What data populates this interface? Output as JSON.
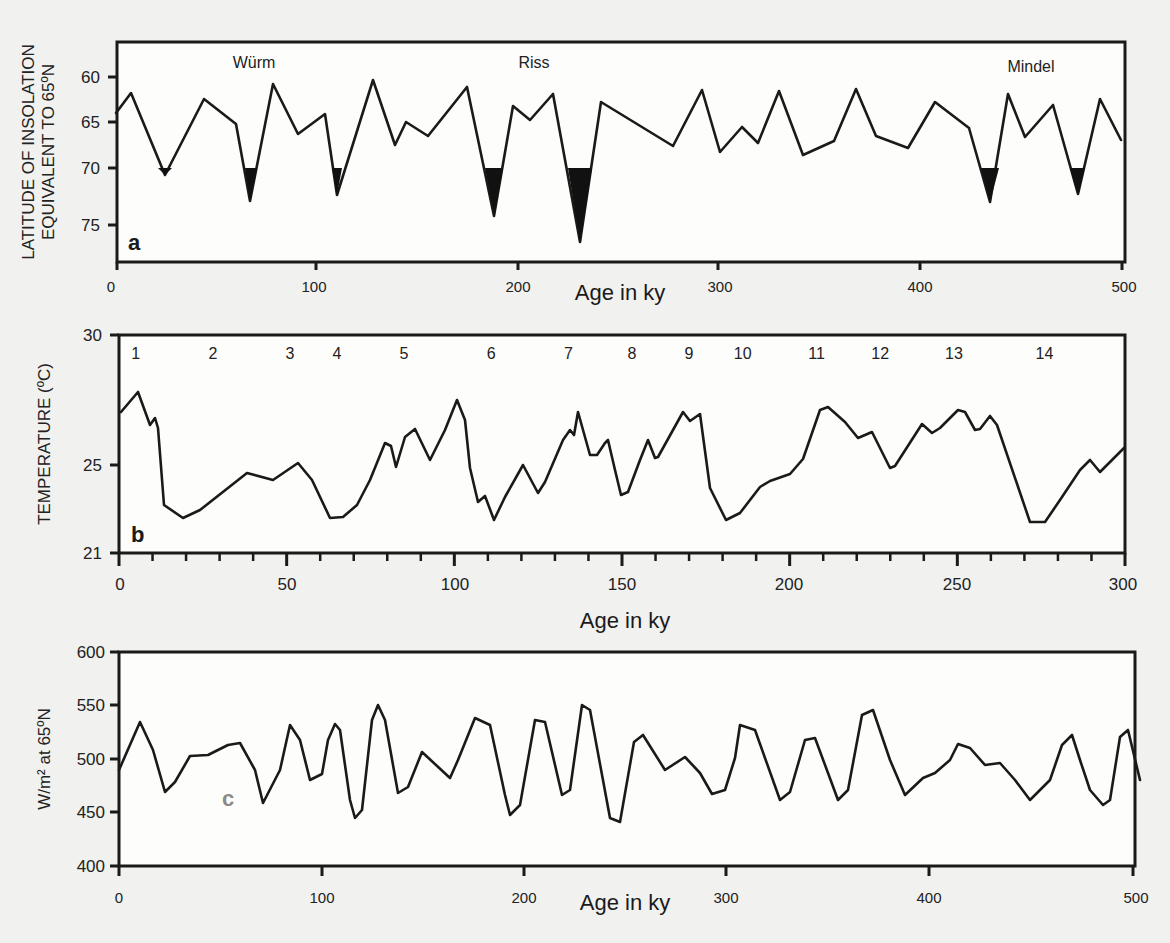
{
  "figure": {
    "panel_a": {
      "label": "a",
      "ylabel_line1": "LATITUDE OF INSOLATION",
      "ylabel_line2": "EQUIVALENT TO 65ºN",
      "xlabel": "Age in ky",
      "yticks": [
        "60",
        "65",
        "70",
        "75"
      ],
      "xticks": [
        "0",
        "100",
        "200",
        "300",
        "400",
        "500"
      ],
      "annotations": [
        "Würm",
        "Riss",
        "Mindel"
      ]
    },
    "panel_b": {
      "label": "b",
      "ylabel": "TEMPERATURE (ºC)",
      "xlabel": "Age in ky",
      "yticks": [
        "30",
        "25",
        "21"
      ],
      "xticks": [
        "0",
        "50",
        "100",
        "150",
        "200",
        "250",
        "300"
      ],
      "stage_numbers": [
        "1",
        "2",
        "3",
        "4",
        "5",
        "6",
        "7",
        "8",
        "9",
        "10",
        "11",
        "12",
        "13",
        "14"
      ]
    },
    "panel_c": {
      "label": "c",
      "ylabel": "W/m² at 65ºN",
      "xlabel": "Age in ky",
      "yticks": [
        "600",
        "550",
        "500",
        "450",
        "400"
      ],
      "xticks": [
        "0",
        "100",
        "200",
        "300",
        "400",
        "500"
      ]
    }
  },
  "chart_data": [
    {
      "type": "line",
      "panel": "a",
      "title": "",
      "xlabel": "Age in ky",
      "ylabel": "Latitude of insolation equivalent to 65ºN",
      "xlim": [
        0,
        500
      ],
      "ylim": [
        78,
        57
      ],
      "y_inverted": true,
      "annotations": [
        {
          "text": "Würm",
          "x": 65
        },
        {
          "text": "Riss",
          "x": 190
        },
        {
          "text": "Mindel",
          "x": 460
        }
      ],
      "shaded_glacial_minima_below": 69,
      "x": [
        0,
        7,
        24,
        43,
        59,
        66,
        77,
        90,
        103,
        109,
        127,
        138,
        143,
        144,
        151,
        161,
        174,
        188,
        197,
        205,
        218,
        229,
        239,
        275,
        290,
        299,
        310,
        318,
        329,
        331,
        343,
        358,
        369,
        380,
        396,
        410,
        428,
        441,
        448,
        456,
        462,
        470,
        484,
        493,
        506
      ],
      "y": [
        63.6,
        61.6,
        69.9,
        62.2,
        64.8,
        72.6,
        60.7,
        65.8,
        63.8,
        72.0,
        60.3,
        66.9,
        67.2,
        64.8,
        66.2,
        61.2,
        74.3,
        63.2,
        64.6,
        62.0,
        77.0,
        62.8,
        67.2,
        61.5,
        67.8,
        65.2,
        66.8,
        61.6,
        62.4,
        68.5,
        67.1,
        61.3,
        66.0,
        67.2,
        62.6,
        65.3,
        72.8,
        61.9,
        65.8,
        62.7,
        71.0,
        62.1,
        65.5,
        64.5,
        66.5
      ]
    },
    {
      "type": "line",
      "panel": "b",
      "title": "",
      "xlabel": "Age in ky",
      "ylabel": "Temperature (ºC)",
      "xlim": [
        0,
        300
      ],
      "ylim": [
        21,
        30
      ],
      "stage_numbers": [
        {
          "n": "1",
          "x": 5
        },
        {
          "n": "2",
          "x": 28
        },
        {
          "n": "3",
          "x": 51
        },
        {
          "n": "4",
          "x": 65
        },
        {
          "n": "5",
          "x": 85
        },
        {
          "n": "6",
          "x": 111
        },
        {
          "n": "7",
          "x": 134
        },
        {
          "n": "8",
          "x": 153
        },
        {
          "n": "9",
          "x": 170
        },
        {
          "n": "10",
          "x": 186
        },
        {
          "n": "11",
          "x": 208
        },
        {
          "n": "12",
          "x": 227
        },
        {
          "n": "13",
          "x": 249
        },
        {
          "n": "14",
          "x": 276
        }
      ],
      "x": [
        1,
        6,
        9,
        11,
        12,
        13,
        19,
        24,
        38,
        46,
        53,
        57,
        63,
        67,
        71,
        75,
        79,
        81,
        84,
        89,
        93,
        96,
        101,
        103,
        105,
        108,
        110,
        112,
        115,
        120,
        125,
        128,
        131,
        133,
        134,
        137,
        140,
        142,
        143,
        145,
        149,
        151,
        155,
        158,
        160,
        166,
        169,
        172,
        175,
        180,
        184,
        191,
        195,
        204,
        209,
        214,
        219,
        221,
        226,
        230,
        234,
        241,
        242,
        250,
        252,
        255,
        260,
        262,
        265,
        268,
        278,
        282,
        287,
        293,
        296,
        299,
        302
      ],
      "y": [
        27.3,
        27.9,
        26.8,
        27.0,
        26.6,
        24.0,
        23.0,
        23.2,
        24.6,
        24.4,
        25.0,
        24.4,
        23.0,
        23.0,
        23.5,
        24.3,
        25.4,
        25.3,
        24.4,
        25.7,
        26.7,
        26.6,
        25.1,
        26.0,
        26.2,
        25.3,
        24.6,
        23.5,
        23.0,
        23.6,
        24.9,
        24.0,
        23.6,
        24.7,
        26.0,
        25.5,
        26.3,
        26.4,
        27.1,
        25.7,
        25.7,
        26.1,
        26.2,
        25.2,
        24.3,
        24.4,
        25.5,
        26.1,
        25.9,
        27.4,
        27.2,
        27.3,
        24.9,
        23.0,
        23.2,
        24.0,
        24.3,
        24.5,
        25.4,
        27.2,
        27.3,
        26.8,
        26.3,
        26.5,
        25.4,
        25.4,
        26.8,
        27.0,
        26.6,
        26.8,
        27.3,
        27.2,
        26.6,
        26.4,
        26.9,
        26.2,
        26.4,
        27.3,
        27.3,
        26.6,
        26.5,
        26.0,
        23.0,
        23.0,
        23.7,
        24.7,
        25.0,
        24.6,
        25.6
      ]
    },
    {
      "type": "line",
      "panel": "c",
      "title": "",
      "xlabel": "Age in ky",
      "ylabel": "W/m² at 65ºN",
      "xlim": [
        0,
        500
      ],
      "ylim": [
        400,
        600
      ],
      "x": [
        0,
        10,
        17,
        23,
        28,
        35,
        44,
        54,
        60,
        67,
        71,
        84,
        89,
        94,
        100,
        104,
        107,
        109,
        114,
        119,
        116,
        122,
        125,
        129,
        138,
        132,
        143,
        149,
        162,
        165,
        175,
        182,
        190,
        191,
        203,
        212,
        220,
        232,
        240,
        249,
        254,
        257,
        265,
        275,
        282,
        289,
        297,
        304,
        307,
        319,
        327,
        339,
        342,
        352,
        358,
        365,
        369,
        374,
        386,
        395,
        400,
        405,
        417,
        423,
        429,
        445,
        453,
        462,
        468,
        480,
        491,
        496,
        504
      ],
      "y": [
        490,
        535,
        508,
        469,
        478,
        502,
        503,
        512,
        517,
        485,
        455,
        485,
        535,
        521,
        483,
        489,
        522,
        538,
        531,
        466,
        446,
        454,
        538,
        553,
        479,
        471,
        479,
        470,
        526,
        538,
        522,
        477,
        451,
        547,
        552,
        485,
        488,
        527,
        535,
        513,
        478,
        456,
        467,
        484,
        523,
        529,
        490,
        474,
        478,
        533,
        535,
        493,
        491,
        547,
        546,
        476,
        460,
        540,
        543,
        489,
        475,
        506,
        510,
        466,
        464,
        497,
        466,
        515,
        509,
        530,
        463,
        450,
        500,
        476
      ]
    },
    {
      "note": "Pixel polylines used by template",
      "panel_a_pixels": "116,113 131,93 165,175 204,99 236,124 250,201 273,84 298,134 325,114 337,195 373,80 395,145 406,122 428,136 467,87 494,216 513,106 530,120 553,94 580,242 601,102 673,146 702,90 720,152 742,127 758,143 779,91 803,155 834,141 856,89 876,136 908,148 935,102 969,128 990,202 1008,94 1025,137 1053,105 1078,194 1100,99 1121,140",
      "panel_a_fills": [
        "158,168 165,175 172,168",
        "245,168 250,201 257,168",
        "332,168 337,195 342,168",
        "485,168 494,216 503,168",
        "568,168 580,242 592,168",
        "981,168 990,202 999,168",
        "1070,168 1078,194 1085,168"
      ],
      "panel_b_pixels": "121,412 138,392 150,425 155,418 158,428 164,505 183,518 200,510 247,473 273,480 298,463 312,480 330,518 343,517 357,505 370,480 385,443 391,446 396,467 405,437 415,429 430,460 445,430 457,400 465,420 470,468 478,502 485,496 494,520 505,497 523,465 538,493 545,482 563,440 570,430 574,435 578,412 590,455 597,455 605,443 608,440 615,470 621,495 628,492 640,460 648,440 655,458 658,457 683,412 690,421 700,414 710,488 726,520 740,513 760,487 770,481 790,474 803,459 820,410 828,407 845,422 858,438 872,432 890,468 895,466 922,424 932,433 940,428 958,410 965,412 975,430 980,429 990,416 997,425 1030,522 1045,522 1060,500 1080,470 1090,460 1100,472 1124,448",
      "panel_c_pixels": "119,770 140,722 153,750 165,792 175,782 190,756 208,755 228,745 240,743 255,770 263,803 280,770 290,725 300,740 310,780 322,774 328,740 335,724 340,730 350,800 355,818 362,810 372,720 378,705 385,720 398,793 408,787 422,752 450,778 458,760 475,718 490,725 505,795 510,815 520,805 535,720 545,722 562,795 570,790 582,705 590,710 610,818 620,822 634,742 643,735 665,770 685,757 700,773 712,794 725,790 735,758 740,725 755,730 780,800 790,792 805,740 815,738 828,773 838,800 848,790 862,715 873,710 890,760 905,795 923,778 935,773 950,760 958,744 970,748 985,765 1000,763 1015,780 1030,800 1050,780 1062,745 1072,735 1080,760 1090,790 1103,805 1110,800 1120,737 1128,730 1140,780"
    }
  ]
}
